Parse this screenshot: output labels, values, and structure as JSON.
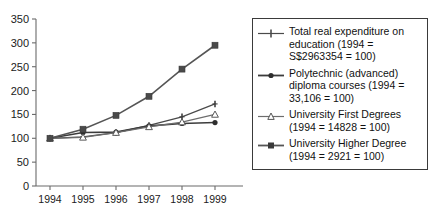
{
  "chart_data": {
    "type": "line",
    "title": "",
    "xlabel": "",
    "ylabel": "",
    "categories": [
      "1994",
      "1995",
      "1996",
      "1997",
      "1998",
      "1999"
    ],
    "x": [
      1994,
      1995,
      1996,
      1997,
      1998,
      1999
    ],
    "ylim": [
      0,
      350
    ],
    "xlim": [
      1994,
      1999
    ],
    "y_ticks": [
      0,
      50,
      100,
      150,
      200,
      250,
      300,
      350
    ],
    "y_tick_labels": [
      "0",
      "50",
      "100",
      "150",
      "200",
      "250",
      "300",
      "350"
    ],
    "x_tick_labels": [
      "1994",
      "1995",
      "1996",
      "1997",
      "1998",
      "1999"
    ],
    "grid": false,
    "legend_position": "right",
    "series": [
      {
        "name": "Total real expenditure on education (1994 = S$2963354 = 100)",
        "legend_line1": "Total real expenditure on",
        "legend_line2": "education (1994 =",
        "legend_line3": "S$2963354 = 100)",
        "marker": "plus-marker",
        "color": "#4a4a4a",
        "values": [
          100,
          103,
          112,
          127,
          145,
          172
        ]
      },
      {
        "name": "Polytechnic (advanced) diploma courses (1994 = 33,106 = 100)",
        "legend_line1": "Polytechnic (advanced)",
        "legend_line2": "diploma courses (1994 =",
        "legend_line3": "33,106 = 100)",
        "marker": "filled-circle-marker",
        "color": "#3c3c3c",
        "values": [
          100,
          112,
          113,
          126,
          131,
          133
        ]
      },
      {
        "name": "University First Degrees (1994 = 14828 = 100)",
        "legend_line1": "University First Degrees",
        "legend_line2": "(1994 = 14828 = 100)",
        "legend_line3": "",
        "marker": "hollow-triangle-marker",
        "color": "#6d6d6d",
        "values": [
          100,
          102,
          112,
          124,
          134,
          150
        ]
      },
      {
        "name": "University Higher Degree (1994 = 2921 = 100)",
        "legend_line1": "University Higher Degree",
        "legend_line2": "(1994 = 2921 = 100)",
        "legend_line3": "",
        "marker": "filled-square-marker",
        "color": "#555555",
        "values": [
          100,
          119,
          148,
          188,
          245,
          295
        ]
      }
    ]
  },
  "colors": {
    "axis": "#6b6b6b",
    "text": "#111111",
    "legend_border": "#3a3a3a",
    "background": "#ffffff"
  }
}
